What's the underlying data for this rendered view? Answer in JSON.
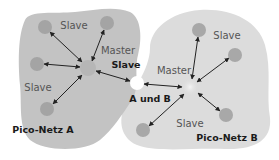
{
  "colors": {
    "region_a": "#c3c3c3",
    "region_b": "#dcdcdc",
    "node_slave": "#a4a4a4",
    "node_master": "#b8b8b8",
    "node_shared": "#ffffff",
    "arrow": "#222222"
  },
  "networks": [
    {
      "name": "Pico-Netz A",
      "master": {
        "label": "Master",
        "x": 88,
        "y": 68
      },
      "slaves": [
        {
          "x": 45,
          "y": 27
        },
        {
          "x": 107,
          "y": 23
        },
        {
          "x": 37,
          "y": 64
        },
        {
          "x": 47,
          "y": 109
        }
      ]
    },
    {
      "name": "Pico-Netz B",
      "master": {
        "label": "Master",
        "x": 190,
        "y": 87
      },
      "slaves": [
        {
          "x": 199,
          "y": 30
        },
        {
          "x": 235,
          "y": 55
        },
        {
          "x": 226,
          "y": 115
        },
        {
          "x": 143,
          "y": 130
        }
      ]
    }
  ],
  "shared_node": {
    "x": 137,
    "y": 83,
    "label": "A und B",
    "role_label": "Slave"
  },
  "labels": {
    "a_slave_top": "Slave",
    "a_master": "Master",
    "a_slave_shared": "Slave",
    "a_slave_left": "Slave",
    "a_name": "Pico-Netz A",
    "shared": "A und B",
    "b_slave_top": "Slave",
    "b_master": "Master",
    "b_slave_bottom": "Slave",
    "b_name": "Pico-Netz B"
  }
}
